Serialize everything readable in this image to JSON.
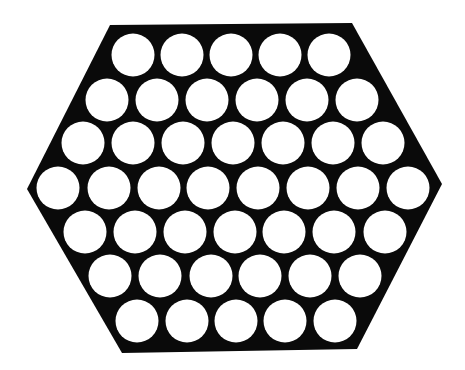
{
  "diagram": {
    "colors": {
      "background": "#ffffff",
      "plate": "#0a0a0a",
      "hole": "#ffffff"
    },
    "hexagon": {
      "points": [
        [
          110,
          25
        ],
        [
          352,
          23
        ],
        [
          442,
          184
        ],
        [
          357,
          349
        ],
        [
          122,
          353
        ],
        [
          27,
          189
        ]
      ]
    },
    "hole_radius": 21.5,
    "rows": [
      {
        "y": 55,
        "x": [
          133,
          182,
          231,
          280,
          329
        ]
      },
      {
        "y": 100,
        "x": [
          107,
          157,
          207,
          257,
          307,
          357
        ]
      },
      {
        "y": 143,
        "x": [
          83,
          133,
          183,
          233,
          283,
          333,
          383
        ]
      },
      {
        "y": 188,
        "x": [
          58,
          109,
          159,
          208,
          258,
          308,
          358,
          408
        ]
      },
      {
        "y": 232,
        "x": [
          85,
          135,
          185,
          235,
          284,
          334,
          385
        ]
      },
      {
        "y": 276,
        "x": [
          110,
          160,
          211,
          260,
          310,
          360
        ]
      },
      {
        "y": 321,
        "x": [
          137,
          187,
          236,
          285,
          335
        ]
      }
    ],
    "row_counts": [
      5,
      6,
      7,
      8,
      7,
      6,
      5
    ],
    "total_holes": 44
  }
}
